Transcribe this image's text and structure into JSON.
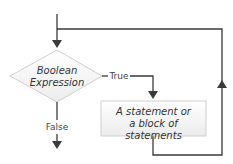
{
  "diagram": {
    "type": "flowchart-while-loop",
    "decision": {
      "line1": "Boolean",
      "line2": "Expression"
    },
    "process": {
      "line1": "A statement or",
      "line2": "a block of statements"
    },
    "edges": {
      "true_label": "True",
      "false_label": "False"
    },
    "colors": {
      "line": "#3a3a3a",
      "shape_fill": "#f4f4f4",
      "shape_stroke": "#c8c8c8"
    }
  }
}
